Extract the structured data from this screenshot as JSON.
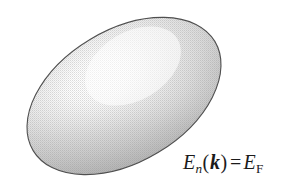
{
  "figure": {
    "background_color": "#ffffff",
    "width": 301,
    "height": 189,
    "caption_equation": {
      "full_text": "E_n(k) = E_F",
      "energy_symbol": "E",
      "band_index_subscript": "n",
      "open_paren": "(",
      "wavevector_symbol": "k",
      "close_paren": ")",
      "equals_sign": "=",
      "fermi_energy_symbol": "E",
      "fermi_subscript": "F"
    },
    "shape": {
      "name": "fermi-surface-ellipse",
      "type": "ellipse",
      "center_x": 124,
      "center_y": 96,
      "semi_major_axis": 106,
      "semi_minor_axis": 66,
      "rotation_degrees": -31,
      "outline_color": "#4f4f4f",
      "outline_width": 1.1,
      "fill_highlight_color": "#ffffff",
      "fill_mid_color": "#d4d4d4",
      "fill_shadow_color": "#a6a6a6",
      "highlight_center_x": 133,
      "highlight_center_y": 66,
      "texture": "halftone-dot-screen"
    }
  }
}
